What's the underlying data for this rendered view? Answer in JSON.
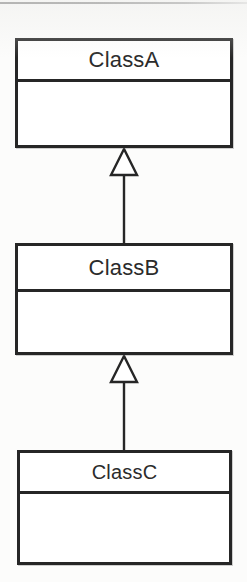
{
  "diagram": {
    "type": "uml-class-diagram",
    "title": "",
    "background_color": "#fcfcfb",
    "line_color": "#262626",
    "fill_color": "#ffffff",
    "text_color": "#2b2b2b",
    "classes": [
      {
        "id": "class-a",
        "name": "ClassA",
        "attributes": [],
        "operations": []
      },
      {
        "id": "class-b",
        "name": "ClassB",
        "attributes": [],
        "operations": []
      },
      {
        "id": "class-c",
        "name": "ClassC",
        "attributes": [],
        "operations": []
      }
    ],
    "relationships": [
      {
        "id": "gen-b-to-a",
        "type": "generalization",
        "source": "ClassB",
        "target": "ClassA",
        "arrowhead": "hollow-triangle"
      },
      {
        "id": "gen-c-to-b",
        "type": "generalization",
        "source": "ClassC",
        "target": "ClassB",
        "arrowhead": "hollow-triangle"
      }
    ]
  }
}
